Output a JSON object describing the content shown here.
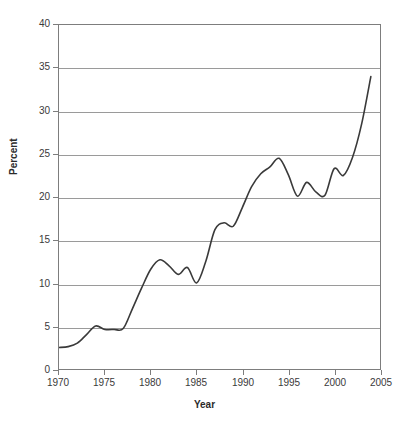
{
  "chart_data": {
    "type": "line",
    "title": "",
    "xlabel": "Year",
    "ylabel": "Percent",
    "xlim": [
      1970,
      2005
    ],
    "ylim": [
      0,
      40
    ],
    "grid": "horizontal",
    "legend": "none",
    "line_color": "#3a3a3a",
    "grid_color": "#9a9a9a",
    "axis_color": "#7d7d7d",
    "background": "#ffffff",
    "xticks": [
      "1970",
      "1975",
      "1980",
      "1985",
      "1990",
      "1995",
      "2000",
      "2005"
    ],
    "xtick_values": [
      1970,
      1975,
      1980,
      1985,
      1990,
      1995,
      2000,
      2005
    ],
    "yticks": [
      "0",
      "5",
      "10",
      "15",
      "20",
      "25",
      "30",
      "35",
      "40"
    ],
    "ytick_values": [
      0,
      5,
      10,
      15,
      20,
      25,
      30,
      35,
      40
    ],
    "x": [
      1970,
      1971,
      1972,
      1973,
      1974,
      1975,
      1976,
      1977,
      1978,
      1979,
      1980,
      1981,
      1982,
      1983,
      1984,
      1985,
      1986,
      1987,
      1988,
      1989,
      1990,
      1991,
      1992,
      1993,
      1994,
      1995,
      1996,
      1997,
      1998,
      1999,
      2000,
      2001,
      2002,
      2003,
      2004
    ],
    "values": [
      2.5,
      2.6,
      3.0,
      4.0,
      5.0,
      4.6,
      4.6,
      4.7,
      7.0,
      9.4,
      11.6,
      12.7,
      12.0,
      11.0,
      11.8,
      10.0,
      12.5,
      16.2,
      17.0,
      16.6,
      18.8,
      21.2,
      22.7,
      23.5,
      24.5,
      22.6,
      20.1,
      21.7,
      20.6,
      20.2,
      23.3,
      22.5,
      24.6,
      28.5,
      34.0
    ]
  }
}
